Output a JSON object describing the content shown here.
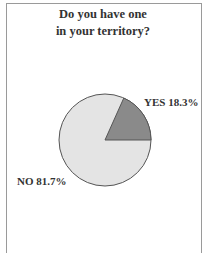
{
  "title_lines": [
    "Do you have one",
    "in your territory?"
  ],
  "labels": {
    "yes": "YES 18.3%",
    "no": "NO 81.7%"
  },
  "colors": {
    "yes": "#8a8a8a",
    "no": "#e4e4e4",
    "outline": "#555555",
    "frame": "#9a9a9a"
  },
  "chart_data": {
    "type": "pie",
    "title": "Do you have one in your territory?",
    "categories": [
      "YES",
      "NO"
    ],
    "values": [
      18.3,
      81.7
    ],
    "unit": "%",
    "labels": [
      "YES 18.3%",
      "NO 81.7%"
    ],
    "legend": "none (inline labels)"
  }
}
